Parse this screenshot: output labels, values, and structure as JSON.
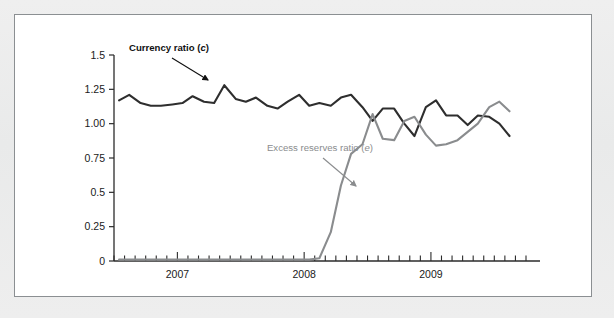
{
  "figure": {
    "background_color": "#eceded",
    "panel_color": "#ffffff",
    "border_color": "#8b8f92"
  },
  "chart_data": {
    "type": "line",
    "title": "",
    "xlabel": "",
    "ylabel": "",
    "xlim": [
      2006.5,
      2009.75
    ],
    "ylim": [
      0,
      1.5
    ],
    "grid": false,
    "legend_position": "inline-annotations",
    "y_ticks": [
      "1.5",
      "1.25",
      "1.00",
      "0.75",
      "0.5",
      "0.25",
      "0"
    ],
    "y_tick_values": [
      1.5,
      1.25,
      1.0,
      0.75,
      0.5,
      0.25,
      0
    ],
    "x_ticks": [
      "2007",
      "2008",
      "2009"
    ],
    "x_tick_values": [
      2007,
      2008,
      2009
    ],
    "x_minor_tick_interval": "monthly",
    "annotations": [
      {
        "key": "currency",
        "text": "Currency ratio (c)",
        "text_plain": "Currency ratio",
        "symbol": "c",
        "color": "#111111",
        "bold": true,
        "arrow_from": [
          171,
          57
        ],
        "arrow_to": [
          207,
          79
        ]
      },
      {
        "key": "excess",
        "text": "Excess reserves ratio (e)",
        "text_plain": "Excess reserves ratio",
        "symbol": "e",
        "color": "#8a8c8e",
        "bold": false,
        "arrow_from": [
          322,
          157
        ],
        "arrow_to": [
          355,
          185
        ]
      }
    ],
    "series": [
      {
        "name": "Currency ratio (c)",
        "key": "currency",
        "color": "#2e2e2e",
        "width": 2.1,
        "x": [
          2006.54,
          2006.62,
          2006.71,
          2006.79,
          2006.87,
          2006.96,
          2007.04,
          2007.12,
          2007.21,
          2007.29,
          2007.37,
          2007.46,
          2007.54,
          2007.62,
          2007.71,
          2007.79,
          2007.87,
          2007.96,
          2008.04,
          2008.12,
          2008.21,
          2008.29,
          2008.37,
          2008.46,
          2008.54,
          2008.62,
          2008.71,
          2008.79,
          2008.87,
          2008.96,
          2009.04,
          2009.12,
          2009.21,
          2009.29,
          2009.37,
          2009.46,
          2009.54,
          2009.62
        ],
        "values": [
          1.17,
          1.21,
          1.15,
          1.13,
          1.13,
          1.14,
          1.15,
          1.2,
          1.16,
          1.15,
          1.28,
          1.18,
          1.16,
          1.19,
          1.13,
          1.11,
          1.16,
          1.21,
          1.13,
          1.15,
          1.13,
          1.19,
          1.21,
          1.12,
          1.02,
          1.11,
          1.11,
          1.0,
          0.91,
          1.12,
          1.17,
          1.06,
          1.06,
          0.99,
          1.06,
          1.05,
          1.0,
          0.91
        ]
      },
      {
        "name": "Excess reserves ratio (e)",
        "key": "excess",
        "color": "#8a8c8e",
        "width": 2.1,
        "x": [
          2006.54,
          2006.62,
          2006.71,
          2006.79,
          2006.87,
          2006.96,
          2007.04,
          2007.12,
          2007.21,
          2007.29,
          2007.37,
          2007.46,
          2007.54,
          2007.62,
          2007.71,
          2007.79,
          2007.87,
          2007.96,
          2008.04,
          2008.12,
          2008.21,
          2008.29,
          2008.37,
          2008.46,
          2008.54,
          2008.62,
          2008.71,
          2008.79,
          2008.87,
          2008.96,
          2009.04,
          2009.12,
          2009.21,
          2009.29,
          2009.37,
          2009.46,
          2009.54,
          2009.62
        ],
        "values": [
          0.01,
          0.01,
          0.01,
          0.01,
          0.01,
          0.01,
          0.01,
          0.01,
          0.01,
          0.01,
          0.01,
          0.01,
          0.01,
          0.01,
          0.01,
          0.01,
          0.01,
          0.01,
          0.01,
          0.02,
          0.21,
          0.55,
          0.78,
          0.85,
          1.07,
          0.89,
          0.88,
          1.02,
          1.05,
          0.92,
          0.84,
          0.85,
          0.88,
          0.94,
          1.0,
          1.12,
          1.16,
          1.09
        ]
      }
    ]
  }
}
